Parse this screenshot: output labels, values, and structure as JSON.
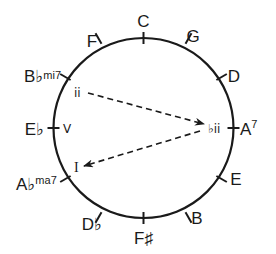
{
  "diagram": {
    "colors": {
      "stroke": "#1a1a1a",
      "background": "#ffffff"
    },
    "circle": {
      "cx": 143.5,
      "cy": 128,
      "r": 90
    },
    "notes": [
      {
        "name": "C",
        "angle": 0,
        "label": "C",
        "sup": ""
      },
      {
        "name": "G",
        "angle": 30,
        "label": "G",
        "sup": ""
      },
      {
        "name": "D",
        "angle": 60,
        "label": "D",
        "sup": ""
      },
      {
        "name": "A",
        "angle": 90,
        "label": "A",
        "sup": "7"
      },
      {
        "name": "E",
        "angle": 120,
        "label": "E",
        "sup": ""
      },
      {
        "name": "B",
        "angle": 150,
        "label": "B",
        "sup": ""
      },
      {
        "name": "F#",
        "angle": 180,
        "label": "F♯",
        "sup": ""
      },
      {
        "name": "Db",
        "angle": 210,
        "label": "D♭",
        "sup": ""
      },
      {
        "name": "Ab",
        "angle": 240,
        "label": "A♭",
        "sup": "ma7"
      },
      {
        "name": "Eb",
        "angle": 270,
        "label": "E♭",
        "sup": ""
      },
      {
        "name": "Bb",
        "angle": 300,
        "label": "B♭",
        "sup": "mi7"
      },
      {
        "name": "F",
        "angle": 330,
        "label": "F",
        "sup": ""
      }
    ],
    "roman_numerals": [
      {
        "name": "ii",
        "label": "ii"
      },
      {
        "name": "V",
        "label": "V"
      },
      {
        "name": "bII",
        "label": "♭ii"
      },
      {
        "name": "I",
        "label": "I"
      }
    ],
    "arrows": [
      {
        "from": "ii",
        "to": "bII",
        "style": "dashed"
      },
      {
        "from": "bII",
        "to": "I",
        "style": "dashed"
      }
    ]
  }
}
